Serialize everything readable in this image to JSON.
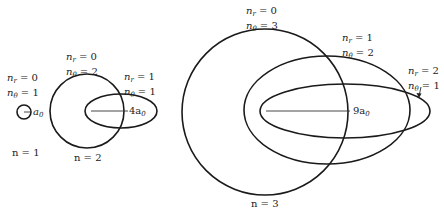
{
  "diagram": {
    "type": "bohr-sommerfeld-orbits",
    "stroke_color": "#1a1a1a",
    "groups": [
      {
        "n_label": "n = 1",
        "orbits": [
          {
            "n_r": "0",
            "n_theta": "1",
            "shape": "circle",
            "radius_label": "a₀"
          }
        ]
      },
      {
        "n_label": "n = 2",
        "orbits": [
          {
            "n_r": "0",
            "n_theta": "2",
            "shape": "circle"
          },
          {
            "n_r": "1",
            "n_theta": "1",
            "shape": "ellipse"
          }
        ],
        "radius_label": "4a₀"
      },
      {
        "n_label": "n = 3",
        "orbits": [
          {
            "n_r": "0",
            "n_theta": "3",
            "shape": "circle"
          },
          {
            "n_r": "1",
            "n_theta": "2",
            "shape": "ellipse"
          },
          {
            "n_r": "2",
            "n_theta": "1",
            "shape": "ellipse"
          }
        ],
        "radius_label": "9a₀"
      }
    ]
  },
  "labels": {
    "sym_nr": "n",
    "sub_r": "r",
    "sym_ntheta": "n",
    "sub_theta": "θ",
    "eq": " = ",
    "g1": {
      "nr": "0",
      "ntheta": "1",
      "radius": "a",
      "radius_sub": "0",
      "n": "n = 1"
    },
    "g2": {
      "c_nr": "0",
      "c_ntheta": "2",
      "e_nr": "1",
      "e_ntheta": "1",
      "radius": "4a",
      "radius_sub": "0",
      "n": "n = 2"
    },
    "g3": {
      "c_nr": "0",
      "c_ntheta": "3",
      "e1_nr": "1",
      "e1_ntheta": "2",
      "e2_nr": "2",
      "e2_ntheta": "1",
      "radius": "9a",
      "radius_sub": "0",
      "n": "n = 3"
    }
  }
}
